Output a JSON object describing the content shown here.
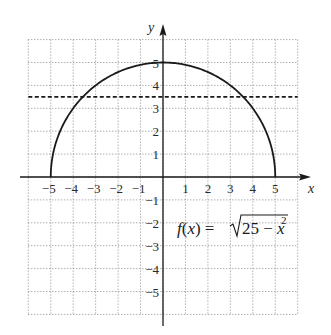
{
  "chart_data": {
    "type": "line",
    "title": "",
    "xlabel": "x",
    "ylabel": "y",
    "xlim": [
      -6,
      6
    ],
    "ylim": [
      -6,
      6
    ],
    "grid": true,
    "grid_style": "dotted",
    "x_tick_labels": [
      "-5",
      "-4",
      "-3",
      "-2",
      "-1",
      "1",
      "2",
      "3",
      "4",
      "5"
    ],
    "y_tick_labels": [
      "5",
      "4",
      "3",
      "2",
      "1",
      "-1",
      "-2",
      "-3",
      "-4",
      "-5"
    ],
    "series": [
      {
        "name": "f(x) = sqrt(25 - x^2)",
        "style": "solid",
        "x": [
          -5,
          -4,
          -3,
          -2,
          -1,
          0,
          1,
          2,
          3,
          4,
          5
        ],
        "y": [
          0,
          3,
          4,
          4.58,
          4.9,
          5,
          4.9,
          4.58,
          4,
          3,
          0
        ]
      },
      {
        "name": "horizontal line y = 3.5",
        "style": "dashed",
        "x": [
          -6,
          6
        ],
        "y": [
          3.5,
          3.5
        ]
      }
    ],
    "annotations": [
      {
        "text_parts": [
          "f",
          "(",
          "x",
          ") = ",
          "√",
          "25 − ",
          "x",
          "2"
        ],
        "at": [
          0.5,
          -2
        ]
      }
    ],
    "legend": "none"
  },
  "labels": {
    "x_axis": "x",
    "y_axis": "y",
    "formula": {
      "f": "f",
      "open": "(",
      "x": "x",
      "close_eq": ") = ",
      "radicand_num": "25 − ",
      "radicand_var": "x",
      "exponent": "2"
    }
  },
  "colors": {
    "ink": "#1a1a1a",
    "grid": "#8a8a8a",
    "background": "#ffffff"
  }
}
